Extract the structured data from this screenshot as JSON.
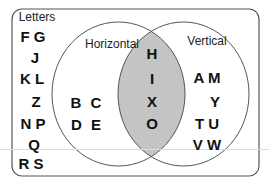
{
  "diagram": {
    "type": "venn",
    "universe_label": "Letters",
    "colors": {
      "frame": "#555555",
      "circle_stroke": "#555555",
      "intersection_fill": "#c4c4c4",
      "text": "#111111",
      "background": "#ffffff"
    },
    "sets": [
      {
        "name": "Horizontal"
      },
      {
        "name": "Vertical"
      }
    ],
    "regions": {
      "outside": [
        "F",
        "G",
        "J",
        "K",
        "L",
        "Z",
        "N",
        "P",
        "Q",
        "R",
        "S"
      ],
      "horizontal_only": [
        "B",
        "C",
        "D",
        "E"
      ],
      "both": [
        "H",
        "I",
        "X",
        "O"
      ],
      "vertical_only": [
        "A",
        "M",
        "Y",
        "T",
        "U",
        "V",
        "W"
      ]
    },
    "rows": {
      "outside": [
        "F G",
        "J",
        "K L",
        "Z",
        "N P",
        "Q",
        "R S"
      ],
      "horizontal_only": [
        "B C",
        "D E"
      ],
      "both": [
        "H",
        "I",
        "X",
        "O"
      ],
      "vertical_only": [
        "A M",
        "Y",
        "T U",
        "V W"
      ]
    }
  }
}
